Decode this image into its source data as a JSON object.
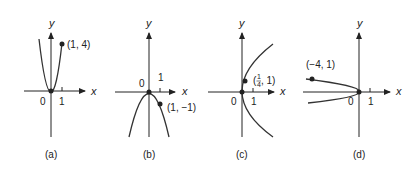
{
  "panels": [
    {
      "id": "a",
      "caption": "(a)",
      "x_axis_label": "x",
      "y_axis_label": "y",
      "origin_label": "0",
      "tick_label": "1",
      "point_label": "(1, 4)",
      "curve": "y = 4x^2 (parabola opening up)"
    },
    {
      "id": "b",
      "caption": "(b)",
      "x_axis_label": "x",
      "y_axis_label": "y",
      "origin_label": "0",
      "tick_label": "1",
      "point_label": "(1, −1)",
      "curve": "y = -x^2 (parabola opening down)"
    },
    {
      "id": "c",
      "caption": "(c)",
      "x_axis_label": "x",
      "y_axis_label": "y",
      "origin_label": "0",
      "tick_label": "1",
      "point_label_num": "1",
      "point_label_den": "4",
      "point_label_rest": ", 1)",
      "point_label_open": "(",
      "curve": "x = y^2/4... parabola opening right"
    },
    {
      "id": "d",
      "caption": "(d)",
      "x_axis_label": "x",
      "y_axis_label": "y",
      "origin_label": "0",
      "tick_label": "1",
      "point_label": "(−4, 1)",
      "curve": "x = -4y^2 (parabola opening left)"
    }
  ],
  "colors": {
    "ink": "#222222",
    "background": "#ffffff"
  }
}
